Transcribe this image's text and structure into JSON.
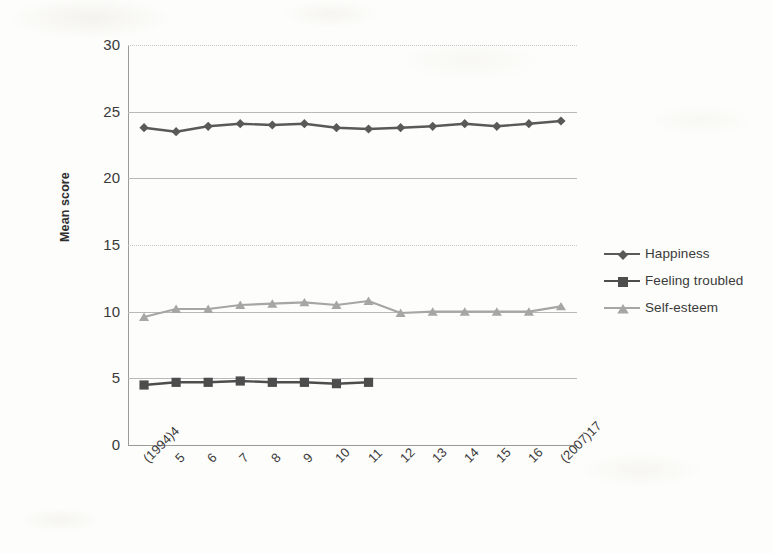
{
  "chart_data": {
    "type": "line",
    "title": "",
    "xlabel": "",
    "ylabel": "Mean score",
    "ylim": [
      0,
      30
    ],
    "yticks": [
      0,
      5,
      10,
      15,
      20,
      25,
      30
    ],
    "grid": true,
    "legend_position": "right",
    "categories": [
      "(1994)4",
      "5",
      "6",
      "7",
      "8",
      "9",
      "10",
      "11",
      "12",
      "13",
      "14",
      "15",
      "16",
      "(2007)17"
    ],
    "series": [
      {
        "name": "Happiness",
        "marker": "diamond",
        "color": "#595959",
        "values": [
          23.8,
          23.5,
          23.9,
          24.1,
          24.0,
          24.1,
          23.8,
          23.7,
          23.8,
          23.9,
          24.1,
          23.9,
          24.1,
          24.3
        ]
      },
      {
        "name": "Feeling troubled",
        "marker": "square",
        "color": "#4d4d4d",
        "values": [
          4.5,
          4.7,
          4.7,
          4.8,
          4.7,
          4.7,
          4.6,
          4.7,
          null,
          null,
          null,
          null,
          null,
          null
        ]
      },
      {
        "name": "Self-esteem",
        "marker": "triangle",
        "color": "#a6a6a6",
        "values": [
          9.6,
          10.2,
          10.2,
          10.5,
          10.6,
          10.7,
          10.5,
          10.8,
          9.9,
          10.0,
          10.0,
          10.0,
          10.0,
          10.4
        ]
      }
    ]
  },
  "axis": {
    "y_title": "Mean score",
    "y_tick_labels": [
      "30",
      "25",
      "20",
      "15",
      "10",
      "5",
      "0"
    ],
    "x_tick_labels": [
      "(1994)4",
      "5",
      "6",
      "7",
      "8",
      "9",
      "10",
      "11",
      "12",
      "13",
      "14",
      "15",
      "16",
      "(2007)17"
    ]
  },
  "legend": {
    "entries": [
      {
        "label": "Happiness",
        "marker": "diamond-marker",
        "color": "#595959"
      },
      {
        "label": "Feeling troubled",
        "marker": "square-marker",
        "color": "#4d4d4d"
      },
      {
        "label": "Self-esteem",
        "marker": "triangle-marker",
        "color": "#a6a6a6"
      }
    ]
  }
}
